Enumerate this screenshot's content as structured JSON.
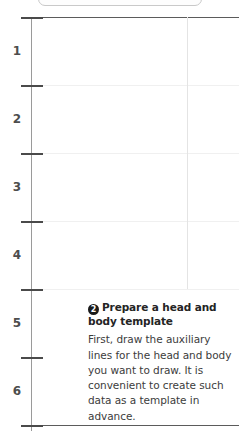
{
  "toolbar": {
    "visible_partial": true,
    "tick_marks": [
      "tick",
      "tick",
      "tick"
    ]
  },
  "ruler": {
    "orientation": "vertical",
    "unit_labels": [
      "1",
      "2",
      "3",
      "4",
      "5",
      "6"
    ],
    "tick_positions": [
      17,
      85,
      153,
      221,
      289,
      357,
      425
    ],
    "major_rule_positions": [
      17,
      425
    ],
    "faint_rule_positions": [
      85,
      153,
      221,
      289
    ],
    "axis_color": "#9a9a9a",
    "tick_color": "#4a4a4a",
    "label_color": "#4d4d4d"
  },
  "guide": {
    "vertical_guide_x": 187,
    "vertical_guide_color": "#e4e4e4"
  },
  "note": {
    "badge": "2",
    "heading": "Prepare a head and body template",
    "body": "First, draw the auxiliary lines for the head and body you want to draw. It is convenient to create such data as a template in advance.",
    "badge_bg": "#1a1a1a",
    "heading_color": "#242424",
    "body_color": "#3c3c3c"
  }
}
